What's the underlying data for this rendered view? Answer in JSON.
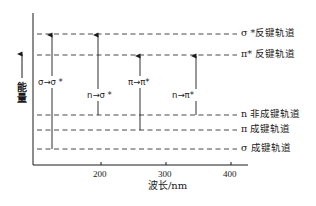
{
  "diagram": {
    "type": "energy-level-diagram",
    "y_axis": {
      "label": "能量",
      "direction": "up"
    },
    "x_axis": {
      "label": "波长/nm",
      "ticks": [
        {
          "value": "200",
          "x": 101
        },
        {
          "value": "300",
          "x": 166
        },
        {
          "value": "400",
          "x": 231
        }
      ]
    },
    "orbitals": [
      {
        "id": "sigma_star",
        "label": "σ *反键轨道",
        "y": 34
      },
      {
        "id": "pi_star",
        "label": "π* 反键轨道",
        "y": 55
      },
      {
        "id": "n",
        "label": "n  非成键轨道",
        "y": 115
      },
      {
        "id": "pi",
        "label": "π  成键轨道",
        "y": 130
      },
      {
        "id": "sigma",
        "label": "σ  成键轨道",
        "y": 149
      }
    ],
    "transitions": [
      {
        "label": "σ→σ *",
        "from": "sigma",
        "to": "sigma_star",
        "x": 52,
        "label_x": 38,
        "label_y": 77
      },
      {
        "label": "n→σ *",
        "from": "n",
        "to": "sigma_star",
        "x": 98,
        "label_x": 87,
        "label_y": 90
      },
      {
        "label": "π→π*",
        "from": "pi",
        "to": "pi_star",
        "x": 140,
        "label_x": 128,
        "label_y": 77
      },
      {
        "label": "n→π*",
        "from": "n",
        "to": "pi_star",
        "x": 196,
        "label_x": 172,
        "label_y": 90
      }
    ],
    "colors": {
      "line": "#1a1a1a",
      "dash": "#333333",
      "background": "#ffffff"
    }
  }
}
